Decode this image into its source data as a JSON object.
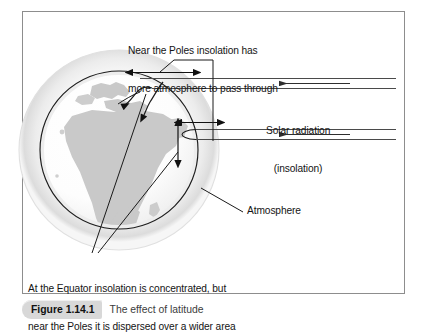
{
  "figure": {
    "border_color": "#8a8a8a",
    "background": "#ffffff",
    "caption": {
      "label": "Figure 1.14.1",
      "title": "The effect of latitude"
    },
    "annotations": {
      "poles_line1": "Near the Poles insolation has",
      "poles_line2": "more atmosphere to pass through",
      "solar_line1": "Solar radiation",
      "solar_line2": "(insolation)",
      "atmosphere": "Atmosphere",
      "equator_line1": "At the Equator insolation is concentrated, but",
      "equator_line2": "near the Poles it is dispersed over a wider area"
    },
    "diagram": {
      "type": "earth-insolation-latitude-diagram",
      "globe_label": "Earth with Africa and Europe landmasses",
      "atmosphere_halo_color": "#e6e6e6",
      "earth_outline_color": "#1a1a1a",
      "land_color": "#c9c9c9",
      "ocean_color": "#fbfbfb",
      "ray_color": "#444444",
      "arrow_color": "#111111",
      "ray_count": 4,
      "ray_direction": "right-to-left",
      "measure_arrows": [
        "polar-atmosphere-path-length",
        "equatorial-atmosphere-path-length",
        "equatorial-beam-width",
        "polar-beam-spread"
      ]
    }
  }
}
